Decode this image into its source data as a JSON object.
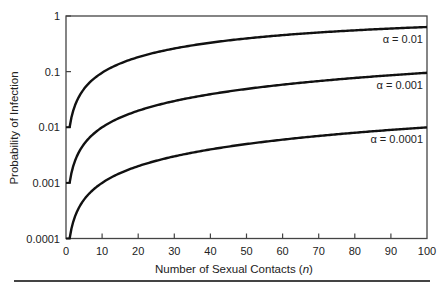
{
  "chart_data": {
    "type": "line",
    "title": "",
    "xlabel": "Number of Sexual Contacts (n)",
    "xlabel_parts": {
      "prefix": "Number of Sexual Contacts (",
      "var": "n",
      "suffix": ")"
    },
    "ylabel": "Probability of Infection",
    "xlim": [
      0,
      100
    ],
    "ylim": [
      0.0001,
      1
    ],
    "yscale": "log",
    "grid": false,
    "x_ticks": [
      0,
      10,
      20,
      30,
      40,
      50,
      60,
      70,
      80,
      90,
      100
    ],
    "x_tick_labels": [
      "0",
      "10",
      "20",
      "30",
      "40",
      "50",
      "60",
      "70",
      "80",
      "90",
      "100"
    ],
    "y_ticks": [
      1,
      0.1,
      0.01,
      0.001,
      0.0001
    ],
    "y_tick_labels": [
      "1",
      "0.1",
      "0.01",
      "0.001",
      "0.0001"
    ],
    "x": [
      1,
      2,
      3,
      5,
      7,
      10,
      15,
      20,
      30,
      40,
      50,
      60,
      70,
      80,
      90,
      100
    ],
    "series": [
      {
        "name": "α = 0.01",
        "alpha": 0.01,
        "values": [
          0.01,
          0.0199,
          0.0297,
          0.049,
          0.0679,
          0.0956,
          0.14,
          0.182,
          0.26,
          0.331,
          0.395,
          0.453,
          0.505,
          0.552,
          0.595,
          0.634
        ]
      },
      {
        "name": "α = 0.001",
        "alpha": 0.001,
        "values": [
          0.001,
          0.002,
          0.003,
          0.005,
          0.007,
          0.00996,
          0.0149,
          0.0198,
          0.0296,
          0.0392,
          0.0488,
          0.0582,
          0.0676,
          0.0769,
          0.0861,
          0.0952
        ]
      },
      {
        "name": "α = 0.0001",
        "alpha": 0.0001,
        "values": [
          0.0001,
          0.0002,
          0.0003,
          0.0005,
          0.0007,
          0.001,
          0.0015,
          0.002,
          0.003,
          0.004,
          0.005,
          0.006,
          0.007,
          0.008,
          0.009,
          0.00995
        ]
      }
    ],
    "annotations": [
      "α = 0.01",
      "α = 0.001",
      "α = 0.0001"
    ],
    "legend": "inline labels at right end of each curve"
  }
}
